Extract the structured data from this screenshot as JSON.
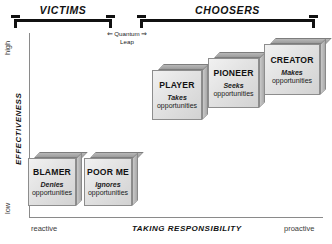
{
  "diagram": {
    "brackets": [
      {
        "id": "victims",
        "label": "VICTIMS"
      },
      {
        "id": "choosers",
        "label": "CHOOSERS"
      }
    ],
    "annotation": {
      "line1": "Quantum",
      "line2": "Leap",
      "left_arrow": "⇐",
      "right_arrow": "⇒"
    },
    "axes": {
      "y": {
        "title": "EFFECTIVENESS",
        "high": "high",
        "low": "low"
      },
      "x": {
        "title": "TAKING RESPONSIBILITY",
        "left": "reactive",
        "right": "proactive"
      }
    },
    "boxes": [
      {
        "id": "blamer",
        "title": "BLAMER",
        "verb": "Denies",
        "object": "opportunities"
      },
      {
        "id": "poor-me",
        "title": "POOR ME",
        "verb": "Ignores",
        "object": "opportunities"
      },
      {
        "id": "player",
        "title": "PLAYER",
        "verb": "Takes",
        "object": "opportunities"
      },
      {
        "id": "pioneer",
        "title": "PIONEER",
        "verb": "Seeks",
        "object": "opportunities"
      },
      {
        "id": "creator",
        "title": "CREATOR",
        "verb": "Makes",
        "object": "opportunities"
      }
    ],
    "colors": {
      "ink": "#111111",
      "axis": "#8a8a8a",
      "box_face": "#e6e6e6",
      "box_top": "#a8a8a8",
      "box_side": "#bdbdbd"
    }
  }
}
